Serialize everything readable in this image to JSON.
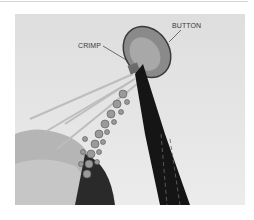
{
  "figure": {
    "labels": {
      "button": "BUTTON",
      "crimp": "CRIMP"
    },
    "colors": {
      "background": "#e4e4e4",
      "pliers": "#151515",
      "label_text": "#3a3a3a"
    }
  }
}
